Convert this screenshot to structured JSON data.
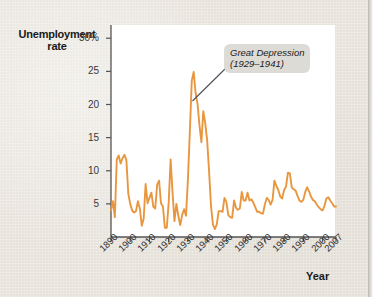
{
  "figure": {
    "background_color": "#e9e5dd",
    "plot_background_color": "#ffffff",
    "line_color": "#e8973f",
    "axis_color": "#555555",
    "annotation_bg_color": "#dddbd6"
  },
  "labels": {
    "y_axis_title_line1": "Unemployment",
    "y_axis_title_line2": "rate",
    "x_axis_title": "Year",
    "annotation_line1": "Great Depression",
    "annotation_line2": "(1929–1941)"
  },
  "chart_data": {
    "type": "line",
    "title": "",
    "xlabel": "Year",
    "ylabel": "Unemployment rate",
    "ylim": [
      0,
      32
    ],
    "xlim": [
      1890,
      2007
    ],
    "grid": false,
    "legend": null,
    "ytick_values": [
      5,
      10,
      15,
      20,
      25,
      30
    ],
    "ytick_labels": [
      "5",
      "10",
      "15",
      "20",
      "25",
      "30%"
    ],
    "xtick_values": [
      1890,
      1900,
      1910,
      1920,
      1930,
      1940,
      1950,
      1960,
      1970,
      1980,
      1990,
      2000,
      2007
    ],
    "xtick_labels": [
      "1890",
      "1900",
      "1910",
      "1920",
      "1930",
      "1940",
      "1950",
      "1960",
      "1970",
      "1980",
      "1990",
      "2000",
      "2007"
    ],
    "annotations": [
      {
        "text": "Great Depression (1929–1941)",
        "x": 1932,
        "y": 25
      }
    ],
    "series": [
      {
        "name": "Unemployment rate",
        "x": [
          1890,
          1891,
          1892,
          1893,
          1894,
          1895,
          1896,
          1897,
          1898,
          1899,
          1900,
          1901,
          1902,
          1903,
          1904,
          1905,
          1906,
          1907,
          1908,
          1909,
          1910,
          1911,
          1912,
          1913,
          1914,
          1915,
          1916,
          1917,
          1918,
          1919,
          1920,
          1921,
          1922,
          1923,
          1924,
          1925,
          1926,
          1927,
          1928,
          1929,
          1930,
          1931,
          1932,
          1933,
          1934,
          1935,
          1936,
          1937,
          1938,
          1939,
          1940,
          1941,
          1942,
          1943,
          1944,
          1945,
          1946,
          1947,
          1948,
          1949,
          1950,
          1951,
          1952,
          1953,
          1954,
          1955,
          1956,
          1957,
          1958,
          1959,
          1960,
          1961,
          1962,
          1963,
          1964,
          1965,
          1966,
          1967,
          1968,
          1969,
          1970,
          1971,
          1972,
          1973,
          1974,
          1975,
          1976,
          1977,
          1978,
          1979,
          1980,
          1981,
          1982,
          1983,
          1984,
          1985,
          1986,
          1987,
          1988,
          1989,
          1990,
          1991,
          1992,
          1993,
          1994,
          1995,
          1996,
          1997,
          1998,
          1999,
          2000,
          2001,
          2002,
          2003,
          2004,
          2005,
          2006,
          2007
        ],
        "values": [
          4.0,
          5.4,
          3.0,
          11.7,
          12.3,
          11.1,
          11.9,
          12.4,
          11.6,
          6.5,
          5.0,
          4.0,
          3.7,
          3.9,
          5.4,
          4.3,
          1.7,
          2.8,
          8.0,
          5.1,
          5.9,
          6.7,
          4.6,
          4.3,
          7.9,
          8.5,
          5.1,
          4.6,
          1.4,
          1.4,
          5.2,
          11.7,
          6.7,
          2.4,
          5.0,
          3.2,
          1.8,
          3.3,
          4.2,
          3.2,
          8.7,
          15.9,
          23.6,
          24.9,
          21.7,
          20.1,
          16.9,
          14.3,
          19.0,
          17.2,
          14.6,
          9.9,
          4.7,
          1.9,
          1.2,
          1.9,
          3.9,
          3.9,
          3.8,
          5.9,
          5.3,
          3.3,
          3.0,
          2.9,
          5.5,
          4.4,
          4.1,
          4.3,
          6.8,
          5.5,
          5.5,
          6.7,
          5.5,
          5.7,
          5.2,
          4.5,
          3.8,
          3.8,
          3.6,
          3.5,
          4.9,
          5.9,
          5.6,
          4.9,
          5.6,
          8.5,
          7.7,
          7.1,
          6.1,
          5.8,
          7.1,
          7.6,
          9.7,
          9.6,
          7.5,
          7.2,
          7.0,
          6.2,
          5.5,
          5.3,
          5.6,
          6.8,
          7.5,
          6.9,
          6.1,
          5.6,
          5.4,
          4.9,
          4.5,
          4.2,
          4.0,
          4.7,
          5.8,
          6.0,
          5.5,
          5.1,
          4.6,
          4.6
        ]
      }
    ]
  }
}
